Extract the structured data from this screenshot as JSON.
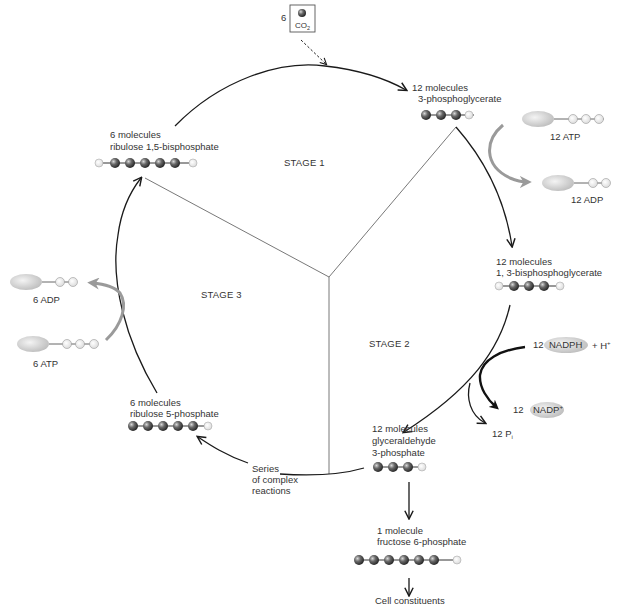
{
  "diagram": {
    "stages": [
      {
        "label": "STAGE 1"
      },
      {
        "label": "STAGE 2"
      },
      {
        "label": "STAGE 3"
      }
    ],
    "co2_input": {
      "count": "6",
      "label": "CO",
      "subscript": "2"
    },
    "molecules": {
      "pga": {
        "line1": "12 molecules",
        "line2": "3-phosphoglycerate",
        "dark_spheres": 3,
        "light_spheres": 1
      },
      "bpg": {
        "line1": "12 molecules",
        "line2": "1, 3-bisphosphoglycerate",
        "dark_spheres": 3,
        "light_spheres": 2
      },
      "g3p": {
        "line1": "12 molecules",
        "line2": "glyceraldehyde",
        "line3": "3-phosphate",
        "dark_spheres": 3,
        "light_spheres": 1
      },
      "ru5p": {
        "line1": "6 molecules",
        "line2": "ribulose 5-phosphate",
        "dark_spheres": 5,
        "light_spheres": 1
      },
      "rubp": {
        "line1": "6 molecules",
        "line2": "ribulose 1,5-bisphosphate",
        "dark_spheres": 5,
        "light_spheres": 2
      },
      "f6p": {
        "line1": "1 molecule",
        "line2": "fructose 6-phosphate",
        "dark_spheres": 6,
        "light_spheres": 1
      }
    },
    "cofactors": {
      "atp_stage2": {
        "label": "12 ATP"
      },
      "adp_stage2": {
        "label": "12 ADP"
      },
      "atp_stage3": {
        "label": "6 ATP"
      },
      "adp_stage3": {
        "label": "6 ADP"
      },
      "nadph": {
        "count": "12",
        "label": "NADPH",
        "extra": "+ H",
        "extra_sup": "+"
      },
      "nadp": {
        "count": "12",
        "label": "NADP",
        "sup": "+"
      },
      "pi": {
        "label": "12 P",
        "sub": "i"
      }
    },
    "annotations": {
      "series_line1": "Series",
      "series_line2": "of complex",
      "series_line3": "reactions",
      "cell_constituents": "Cell constituents"
    },
    "colors": {
      "dark_sphere": "#555555",
      "light_sphere": "#f2f2f2",
      "cycle_arrow": "#1a1a1a",
      "cofactor_arrow": "#9a9a9a",
      "ellipse": "#d0d0d0"
    }
  }
}
